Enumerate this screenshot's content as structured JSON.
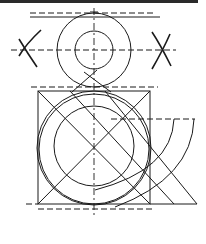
{
  "diagram": {
    "colors": {
      "line": "#1a1a1a",
      "background": "#ffffff"
    },
    "top_border": {
      "y": 1.5,
      "x1": 0,
      "x2": 198
    },
    "upper_loop": {
      "center": [
        94,
        50
      ],
      "outer_radius": 37,
      "inner_radius": 19
    },
    "markers": [
      {
        "name": "left-x-marker",
        "center": [
          24,
          50
        ]
      },
      {
        "name": "right-x-marker",
        "center": [
          164,
          50
        ]
      }
    ],
    "box": {
      "x": 38,
      "y": 91,
      "width": 112,
      "height": 113
    },
    "lower_bowl": {
      "center": [
        94,
        148
      ],
      "outer_radius": 57,
      "outer_radius_2": 55,
      "inner_radius": 40
    },
    "guides": {
      "top_dash_y": 13,
      "top_solid_y": 17,
      "mid_dash_y": 87,
      "tail_dash_y": 119,
      "bottom_line_y": 204,
      "bottom_dash_y": 209,
      "center_x": 94
    }
  }
}
